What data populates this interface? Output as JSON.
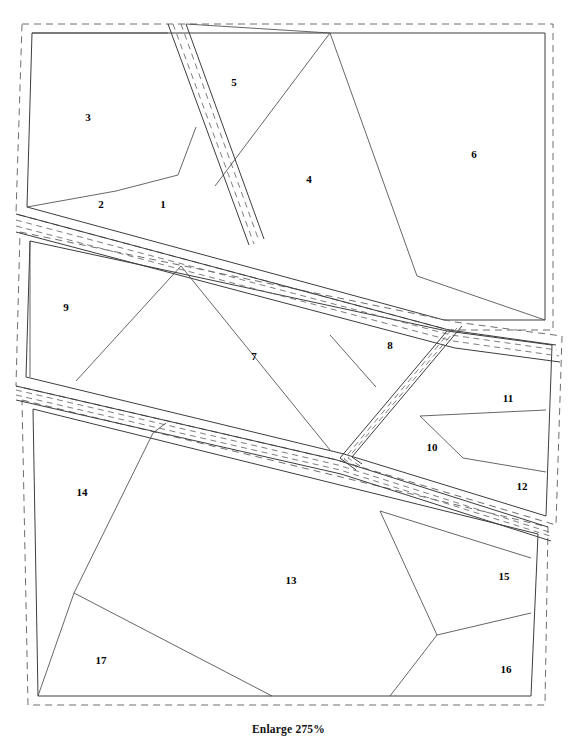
{
  "figure": {
    "caption": "Enlarge 275%",
    "width": 577,
    "height": 744
  },
  "colors": {
    "background": "#ffffff",
    "block_outline": "#3d3d3d",
    "block_dashed": "#6e6e6e",
    "road_dashed": "#6e6e6e",
    "lot_line": "#4a4a4a",
    "label_text": "#000000"
  },
  "blocks": [
    {
      "id": "block-north",
      "name": "northern-block",
      "dashed": "M22,24 L553,24 L553,330 L449,330 L16,214 Z",
      "outline": "M32,33 L545,33 L545,320 L444,320 L27,207 Z"
    },
    {
      "id": "block-middle",
      "name": "middle-block",
      "dashed": "M20,232 L455,322 L562,336 L556,525 L337,460 L16,386 Z",
      "outline": "M30,241 L447,331 L552,345 L546,516 L344,454 L26,377 Z"
    },
    {
      "id": "block-south",
      "name": "southern-block",
      "dashed": "M22,400 L548,527 L545,705 L28,705 Z",
      "outline": "M33,409 L538,534 L531,696 L38,696 Z"
    }
  ],
  "roads": [
    {
      "id": "road-vertical",
      "name": "vertical-road-corridor",
      "edges": [
        "M168,24 L249,245",
        "M186,24 L264,239"
      ],
      "dashes": [
        "M173,24 L254,244",
        "M181,24 L259,241"
      ]
    },
    {
      "id": "road-diagonal-main",
      "name": "main-diagonal-road",
      "edges": [
        "M16,214 L449,330 L556,345",
        "M16,232 L455,348 L560,362"
      ],
      "dashes": [
        "M16,220 L451,335 L557,350",
        "M16,226 L453,341 L559,356"
      ]
    },
    {
      "id": "road-lower-diagonal",
      "name": "lower-diagonal-road",
      "edges": [
        "M16,386 L337,460 L548,527",
        "M16,400 L341,474 L551,541"
      ],
      "dashes": [
        "M16,390 L338,465 L549,532",
        "M16,395 L340,470 L550,536"
      ]
    },
    {
      "id": "road-branch-v",
      "name": "v-branch-road",
      "edges": [
        "M447,331 L340,458 L356,470",
        "M462,326 L352,457 L362,464"
      ],
      "dashes": [
        "M452,329 L344,459 L358,468",
        "M457,328 L348,458 L360,466"
      ]
    }
  ],
  "parcels": [
    {
      "number": "1",
      "label_x": 163,
      "label_y": 205,
      "lines": [
        "M116,191 L178,175",
        "M178,175 L196,127"
      ]
    },
    {
      "number": "2",
      "label_x": 101,
      "label_y": 205,
      "lines": [
        "M27,207 L116,191"
      ]
    },
    {
      "number": "3",
      "label_x": 88,
      "label_y": 118,
      "lines": [
        "M32,33 L168,33"
      ]
    },
    {
      "number": "4",
      "label_x": 309,
      "label_y": 180,
      "lines": [
        "M330,33 L215,186",
        "M330,33 L417,276"
      ]
    },
    {
      "number": "5",
      "label_x": 234,
      "label_y": 83,
      "lines": [
        "M186,24 L330,33"
      ]
    },
    {
      "number": "6",
      "label_x": 474,
      "label_y": 155,
      "lines": [
        "M417,276 L545,320"
      ]
    },
    {
      "number": "7",
      "label_x": 254,
      "label_y": 357,
      "lines": [
        "M181,266 L76,381",
        "M181,266 L330,450"
      ]
    },
    {
      "number": "8",
      "label_x": 390,
      "label_y": 346,
      "lines": [
        "M330,335 L376,387"
      ]
    },
    {
      "number": "9",
      "label_x": 66,
      "label_y": 308,
      "lines": [
        "M30,241 L30,377"
      ]
    },
    {
      "number": "10",
      "label_x": 432,
      "label_y": 448,
      "lines": [
        "M420,416 L463,458"
      ]
    },
    {
      "number": "11",
      "label_x": 508,
      "label_y": 399,
      "lines": [
        "M420,416 L546,410"
      ]
    },
    {
      "number": "12",
      "label_x": 522,
      "label_y": 487,
      "lines": [
        "M463,458 L546,472"
      ]
    },
    {
      "number": "13",
      "label_x": 291,
      "label_y": 581,
      "lines": [
        "M74,593 L272,696",
        "M74,593 L153,433",
        "M380,511 L437,635",
        "M437,635 L390,696"
      ]
    },
    {
      "number": "14",
      "label_x": 82,
      "label_y": 493,
      "lines": [
        "M153,433 L166,423"
      ]
    },
    {
      "number": "15",
      "label_x": 504,
      "label_y": 577,
      "lines": [
        "M380,511 L531,558"
      ]
    },
    {
      "number": "16",
      "label_x": 506,
      "label_y": 670,
      "lines": [
        "M437,635 L531,613"
      ]
    },
    {
      "number": "17",
      "label_x": 101,
      "label_y": 661,
      "lines": [
        "M38,696 L74,593"
      ]
    }
  ]
}
